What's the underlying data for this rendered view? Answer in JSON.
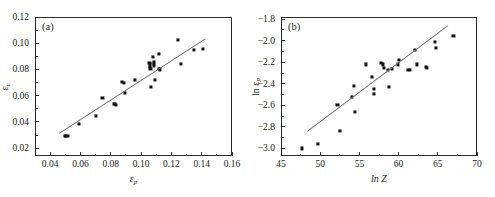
{
  "figure": {
    "panels": [
      {
        "tag": "(a)",
        "xlabel_main": "ε",
        "xlabel_sub": "p",
        "ylabel_main": "ε",
        "ylabel_sub": "c",
        "xticks": [
          "0.04",
          "0.06",
          "0.08",
          "0.10",
          "0.12",
          "0.14",
          "0.16"
        ],
        "yticks": [
          "0.02",
          "0.04",
          "0.06",
          "0.08",
          "0.10",
          "0.12"
        ]
      },
      {
        "tag": "(b)",
        "xlabel_main": "ln Z",
        "xlabel_sub": "",
        "ylabel_main": "ln ε",
        "ylabel_sub": "p",
        "xticks": [
          "45",
          "50",
          "55",
          "60",
          "65",
          "70"
        ],
        "yticks": [
          "−1.8",
          "−2.0",
          "−2.2",
          "−2.4",
          "−2.6",
          "−2.8",
          "−3.0"
        ]
      }
    ]
  },
  "chart_data": [
    {
      "type": "scatter",
      "panel": "(a)",
      "title": "",
      "xlabel": "εp",
      "ylabel": "εc",
      "xlim": [
        0.03,
        0.16
      ],
      "ylim": [
        0.014,
        0.12
      ],
      "xticks": [
        0.04,
        0.06,
        0.08,
        0.1,
        0.12,
        0.14,
        0.16
      ],
      "yticks": [
        0.02,
        0.04,
        0.06,
        0.08,
        0.1,
        0.12
      ],
      "grid": false,
      "legend": null,
      "points": [
        [
          0.0495,
          0.0295
        ],
        [
          0.0505,
          0.0292
        ],
        [
          0.0515,
          0.0296
        ],
        [
          0.059,
          0.0386
        ],
        [
          0.0705,
          0.0448
        ],
        [
          0.0745,
          0.0582
        ],
        [
          0.082,
          0.054
        ],
        [
          0.0828,
          0.0534
        ],
        [
          0.0835,
          0.053
        ],
        [
          0.0875,
          0.0706
        ],
        [
          0.0888,
          0.07
        ],
        [
          0.0892,
          0.062
        ],
        [
          0.096,
          0.0718
        ],
        [
          0.1055,
          0.085
        ],
        [
          0.1058,
          0.0838
        ],
        [
          0.106,
          0.082
        ],
        [
          0.1062,
          0.0806
        ],
        [
          0.1065,
          0.0668
        ],
        [
          0.108,
          0.0892
        ],
        [
          0.1082,
          0.086
        ],
        [
          0.1084,
          0.0845
        ],
        [
          0.1086,
          0.0828
        ],
        [
          0.109,
          0.0722
        ],
        [
          0.1115,
          0.092
        ],
        [
          0.1118,
          0.0805
        ],
        [
          0.1122,
          0.08
        ],
        [
          0.1245,
          0.1022
        ],
        [
          0.1262,
          0.0842
        ],
        [
          0.1348,
          0.0948
        ],
        [
          0.1408,
          0.0958
        ]
      ],
      "fit_line": {
        "x": [
          0.046,
          0.1425
        ],
        "y": [
          0.0318,
          0.104
        ]
      }
    },
    {
      "type": "scatter",
      "panel": "(b)",
      "title": "",
      "xlabel": "ln Z",
      "ylabel": "ln εp",
      "xlim": [
        45,
        70
      ],
      "ylim": [
        -3.07,
        -1.78
      ],
      "xticks": [
        45,
        50,
        55,
        60,
        65,
        70
      ],
      "yticks": [
        -1.8,
        -2.0,
        -2.2,
        -2.4,
        -2.6,
        -2.8,
        -3.0
      ],
      "grid": false,
      "legend": null,
      "points": [
        [
          47.7,
          -3.0
        ],
        [
          49.7,
          -2.96
        ],
        [
          52.2,
          -2.6
        ],
        [
          52.5,
          -2.84
        ],
        [
          54.1,
          -2.52
        ],
        [
          54.3,
          -2.42
        ],
        [
          54.4,
          -2.66
        ],
        [
          55.8,
          -2.22
        ],
        [
          56.6,
          -2.34
        ],
        [
          56.8,
          -2.45
        ],
        [
          56.9,
          -2.49
        ],
        [
          57.8,
          -2.21
        ],
        [
          58.0,
          -2.22
        ],
        [
          58.1,
          -2.25
        ],
        [
          58.6,
          -2.27
        ],
        [
          58.8,
          -2.43
        ],
        [
          59.2,
          -2.26
        ],
        [
          59.9,
          -2.22
        ],
        [
          60.0,
          -2.18
        ],
        [
          61.2,
          -2.27
        ],
        [
          61.5,
          -2.27
        ],
        [
          62.1,
          -2.09
        ],
        [
          62.3,
          -2.22
        ],
        [
          63.5,
          -2.24
        ],
        [
          63.6,
          -2.25
        ],
        [
          64.6,
          -2.01
        ],
        [
          64.8,
          -2.07
        ],
        [
          67.0,
          -1.96
        ]
      ],
      "fit_line": {
        "x": [
          48.3,
          66.2
        ],
        "y": [
          -2.84,
          -1.86
        ]
      }
    }
  ]
}
